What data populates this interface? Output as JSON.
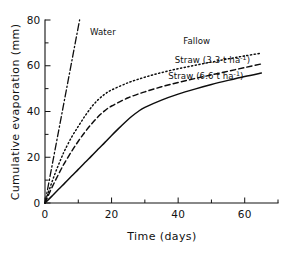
{
  "figure": {
    "background_color": "#ffffff",
    "ink_color": "#0d0d0d"
  },
  "chart_data": {
    "type": "line",
    "title": "",
    "subtitle": "",
    "xlabel": "Time (days)",
    "ylabel": "Cumulative evaporation (mm)",
    "xlim": [
      0,
      70
    ],
    "ylim": [
      0,
      80
    ],
    "xticks": [
      0,
      20,
      40,
      60
    ],
    "xticklabels": [
      "0",
      "20",
      "40",
      "60"
    ],
    "xminorticks": [
      10,
      30,
      50,
      70
    ],
    "yticks": [
      0,
      20,
      40,
      60,
      80
    ],
    "yticklabels": [
      "0",
      "20",
      "40",
      "60",
      "80"
    ],
    "yminorticks": [
      10,
      30,
      50,
      70
    ],
    "grid": false,
    "legend": "inline-annotations",
    "legend_position": "inline",
    "series": [
      {
        "name": "Water",
        "label": "Water",
        "linestyle": "dash-dot",
        "x": [
          0,
          1,
          2,
          3,
          4,
          5,
          6,
          7,
          8,
          9,
          10,
          10.4
        ],
        "values": [
          0,
          7.7,
          15.4,
          23.1,
          30.8,
          38.5,
          46.2,
          53.9,
          61.6,
          69.3,
          77.0,
          80.0
        ],
        "label_x": 13.5,
        "label_y": 73.5
      },
      {
        "name": "Fallow",
        "label": "Fallow",
        "linestyle": "dotted",
        "x": [
          0,
          1,
          2,
          3,
          4,
          5,
          6,
          8,
          10,
          12,
          14,
          16,
          18,
          20,
          25,
          30,
          35,
          40,
          45,
          50,
          55,
          60,
          65
        ],
        "values": [
          0,
          4.5,
          8.8,
          12.8,
          16.5,
          20.0,
          23.2,
          28.8,
          33.5,
          38.0,
          42.0,
          45.2,
          47.6,
          49.4,
          52.6,
          55.0,
          57.0,
          58.7,
          60.2,
          61.6,
          63.0,
          64.3,
          65.5
        ],
        "label_x": 41.5,
        "label_y": 69.5
      },
      {
        "name": "Straw (3.3 t ha-1)",
        "label_prefix": "Straw (3.3 t ha",
        "label_sup": "-1",
        "label_suffix": ")",
        "linestyle": "dashed",
        "x": [
          0,
          1,
          2,
          3,
          4,
          5,
          6,
          8,
          10,
          12,
          14,
          16,
          18,
          20,
          25,
          30,
          35,
          40,
          45,
          50,
          55,
          60,
          65
        ],
        "values": [
          0,
          3.3,
          6.5,
          9.5,
          12.4,
          15.2,
          17.8,
          22.6,
          27.0,
          31.0,
          34.6,
          37.8,
          40.4,
          42.4,
          46.0,
          48.6,
          50.8,
          52.7,
          54.4,
          56.0,
          57.6,
          59.2,
          60.8
        ],
        "label_x": 39.0,
        "label_y": 61.0
      },
      {
        "name": "Straw (6.6 t ha-1)",
        "label_prefix": "Straw (6.6 t ha",
        "label_sup": "-1",
        "label_suffix": ")",
        "linestyle": "solid",
        "x": [
          0,
          2,
          4,
          6,
          8,
          10,
          12,
          14,
          16,
          18,
          20,
          22,
          24,
          26,
          28,
          30,
          35,
          40,
          45,
          50,
          55,
          60,
          65
        ],
        "values": [
          0,
          2.9,
          5.9,
          8.8,
          11.8,
          14.7,
          17.7,
          20.6,
          23.6,
          26.5,
          29.5,
          32.4,
          35.2,
          37.8,
          40.0,
          41.8,
          45.0,
          47.6,
          49.8,
          51.8,
          53.6,
          55.3,
          56.8
        ],
        "label_x": 37.0,
        "label_y": 54.0
      }
    ]
  }
}
